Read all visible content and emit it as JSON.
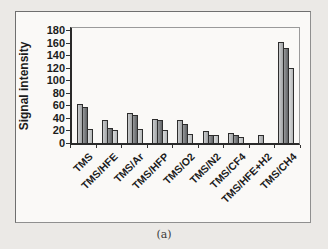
{
  "figure": {
    "caption": "(a)"
  },
  "chart_data": {
    "type": "bar",
    "title": "",
    "xlabel": "",
    "ylabel": "Signal intensity",
    "ylim": [
      0,
      180
    ],
    "y_tick_step": 20,
    "y_ticks": [
      0,
      20,
      40,
      60,
      80,
      100,
      120,
      140,
      160,
      180
    ],
    "grid": false,
    "legend_position": "none",
    "categories": [
      "TMS",
      "TMS/HFE",
      "TMS/Ar",
      "TMS/HFP",
      "TMS/O2",
      "TMS/N2",
      "TMS/CF4",
      "TMS/HFE+H2",
      "TMS/CH4"
    ],
    "series": [
      {
        "name": "series-1",
        "color": "#b3b6b8",
        "values": [
          62,
          36,
          47,
          38,
          36,
          19,
          16,
          12,
          161
        ]
      },
      {
        "name": "series-2",
        "color": "#6b6e71",
        "values": [
          58,
          24,
          45,
          37,
          30,
          13,
          12,
          0,
          151
        ]
      },
      {
        "name": "series-3",
        "color": "#c9cccd",
        "values": [
          23,
          20,
          22,
          20,
          15,
          12,
          9,
          0,
          120
        ]
      }
    ]
  }
}
